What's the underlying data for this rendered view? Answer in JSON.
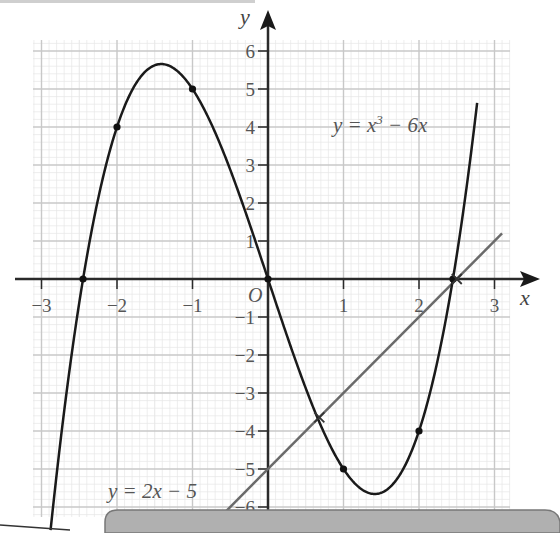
{
  "chart_data": {
    "type": "line",
    "title": "",
    "xlabel": "x",
    "ylabel": "y",
    "origin_label": "O",
    "xlim": [
      -3.3,
      3.2
    ],
    "ylim": [
      -6.3,
      6.3
    ],
    "grid": true,
    "x_ticks": [
      -3,
      -2,
      -1,
      1,
      2,
      3
    ],
    "x_tick_labels": [
      "−3",
      "−2",
      "−1",
      "1",
      "2",
      "3"
    ],
    "y_ticks": [
      6,
      5,
      4,
      3,
      2,
      1,
      -1,
      -2,
      -3,
      -4,
      -5,
      -6
    ],
    "y_tick_labels": [
      "6",
      "5",
      "4",
      "3",
      "2",
      "1",
      "−1",
      "−2",
      "−3",
      "−4",
      "−5",
      "−6"
    ],
    "series": [
      {
        "name": "y = x³ − 6x",
        "expression": "x^3 - 6x",
        "color": "#1a1a1a",
        "x_range": [
          -2.88,
          2.77
        ],
        "x": [
          -2.5,
          -2,
          -1,
          0,
          1,
          2,
          2.45
        ],
        "y": [
          -0.6,
          4,
          5,
          0,
          -5,
          -4,
          0
        ],
        "marked_points": [
          {
            "x": -2.45,
            "y": 0
          },
          {
            "x": -2,
            "y": 4
          },
          {
            "x": -1,
            "y": 5
          },
          {
            "x": 0,
            "y": 0
          },
          {
            "x": 1,
            "y": -5
          },
          {
            "x": 2,
            "y": -4
          },
          {
            "x": 2.45,
            "y": 0
          }
        ],
        "turning_points": [
          {
            "x": -1.41,
            "y": 5.66
          },
          {
            "x": 1.41,
            "y": -5.66
          }
        ]
      },
      {
        "name": "y = 2x − 5",
        "expression": "2x - 5",
        "color": "#6a6a6a",
        "x_range": [
          -0.6,
          3.1
        ],
        "x": [
          -0.6,
          0,
          0.68,
          2.5,
          3.1
        ],
        "y": [
          -6.2,
          -5,
          -3.64,
          0,
          1.2
        ],
        "intersections": [
          {
            "x": 0.68,
            "y": -3.64
          },
          {
            "x": 2.5,
            "y": 0
          }
        ]
      }
    ],
    "annotations": [
      {
        "text": "y = x³ − 6x",
        "position": "upper right"
      },
      {
        "text": "y = 2x − 5",
        "position": "lower left"
      }
    ]
  },
  "labels": {
    "curve_eq_prefix": "y = x",
    "curve_eq_exp": "3",
    "curve_eq_suffix": " − 6x",
    "line_eq": "y = 2x − 5",
    "x_axis": "x",
    "y_axis": "y",
    "origin": "O"
  },
  "colors": {
    "grid_major": "#c8c8c8",
    "grid_minor": "#e6e6e6",
    "axis": "#2a2a2a",
    "curve": "#1a1a1a",
    "line": "#6a6a6a",
    "footer_box": "#b0b0b0"
  }
}
